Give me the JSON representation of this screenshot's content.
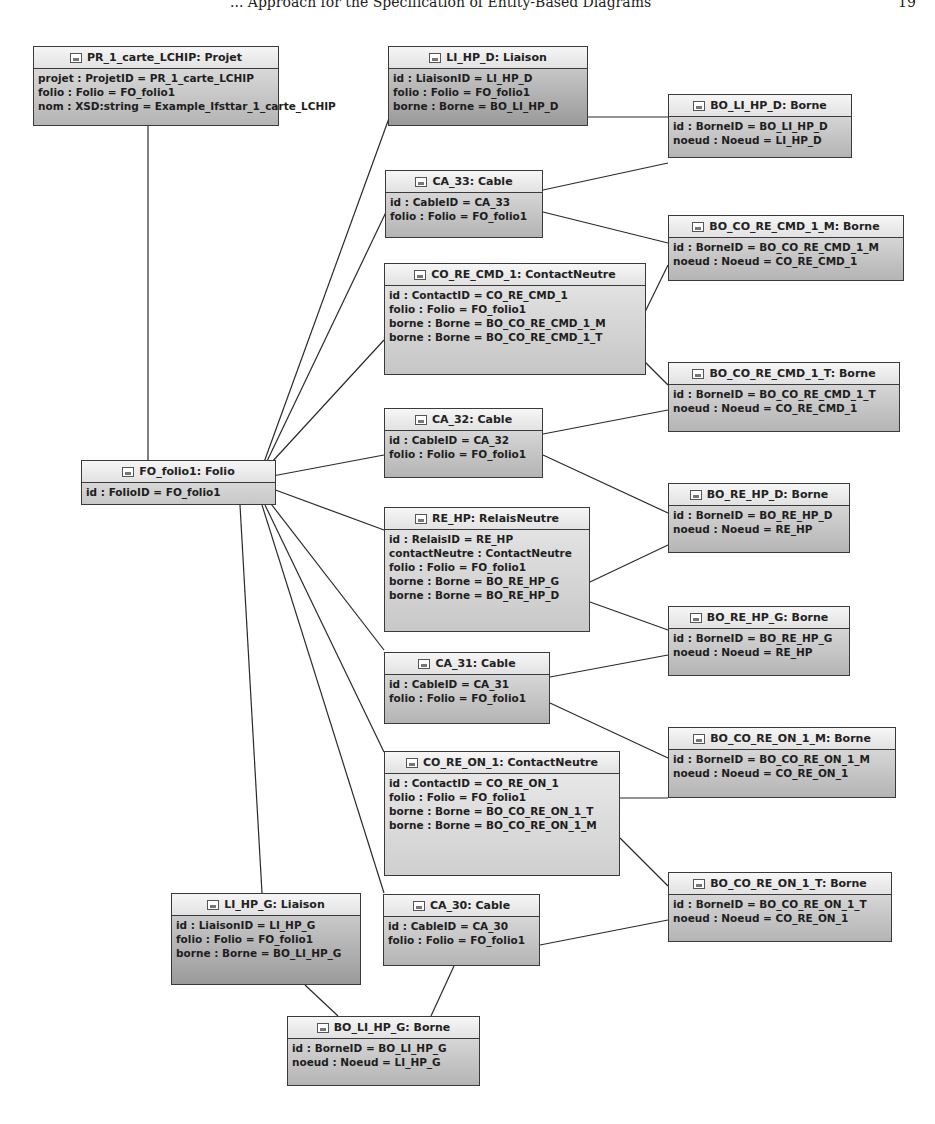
{
  "page_header": {
    "title": "... Approach for the Specification of Entity-Based Diagrams",
    "page_number": "19"
  },
  "nodes": {
    "projet": {
      "title": "PR_1_carte_LCHIP: Projet",
      "attrs": [
        "projet : ProjetID = PR_1_carte_LCHIP",
        "folio : Folio = FO_folio1",
        "nom : XSD:string = Example_Ifsttar_1_carte_LCHIP"
      ]
    },
    "li_hp_d": {
      "title": "LI_HP_D: Liaison",
      "attrs": [
        "id : LiaisonID = LI_HP_D",
        "folio : Folio = FO_folio1",
        "borne : Borne = BO_LI_HP_D"
      ]
    },
    "bo_li_hp_d": {
      "title": "BO_LI_HP_D: Borne",
      "attrs": [
        "id : BorneID = BO_LI_HP_D",
        "noeud : Noeud = LI_HP_D"
      ]
    },
    "ca_33": {
      "title": "CA_33: Cable",
      "attrs": [
        "id : CableID = CA_33",
        "folio : Folio = FO_folio1"
      ]
    },
    "bo_co_re_cmd_1_m": {
      "title": "BO_CO_RE_CMD_1_M: Borne",
      "attrs": [
        "id : BorneID = BO_CO_RE_CMD_1_M",
        "noeud : Noeud = CO_RE_CMD_1"
      ]
    },
    "co_re_cmd_1": {
      "title": "CO_RE_CMD_1: ContactNeutre",
      "attrs": [
        "id : ContactID = CO_RE_CMD_1",
        "folio : Folio = FO_folio1",
        "borne : Borne = BO_CO_RE_CMD_1_M",
        "borne : Borne = BO_CO_RE_CMD_1_T"
      ]
    },
    "bo_co_re_cmd_1_t": {
      "title": "BO_CO_RE_CMD_1_T: Borne",
      "attrs": [
        "id : BorneID = BO_CO_RE_CMD_1_T",
        "noeud : Noeud = CO_RE_CMD_1"
      ]
    },
    "fo_folio1": {
      "title": "FO_folio1: Folio",
      "attrs": [
        "id : FolioID = FO_folio1"
      ]
    },
    "ca_32": {
      "title": "CA_32: Cable",
      "attrs": [
        "id : CableID = CA_32",
        "folio : Folio = FO_folio1"
      ]
    },
    "bo_re_hp_d": {
      "title": "BO_RE_HP_D: Borne",
      "attrs": [
        "id : BorneID = BO_RE_HP_D",
        "noeud : Noeud = RE_HP"
      ]
    },
    "re_hp": {
      "title": "RE_HP: RelaisNeutre",
      "attrs": [
        "id : RelaisID = RE_HP",
        "contactNeutre : ContactNeutre",
        "folio : Folio = FO_folio1",
        "borne : Borne = BO_RE_HP_G",
        "borne : Borne = BO_RE_HP_D"
      ]
    },
    "bo_re_hp_g": {
      "title": "BO_RE_HP_G: Borne",
      "attrs": [
        "id : BorneID = BO_RE_HP_G",
        "noeud : Noeud = RE_HP"
      ]
    },
    "ca_31": {
      "title": "CA_31: Cable",
      "attrs": [
        "id : CableID = CA_31",
        "folio : Folio = FO_folio1"
      ]
    },
    "bo_co_re_on_1_m": {
      "title": "BO_CO_RE_ON_1_M: Borne",
      "attrs": [
        "id : BorneID = BO_CO_RE_ON_1_M",
        "noeud : Noeud = CO_RE_ON_1"
      ]
    },
    "co_re_on_1": {
      "title": "CO_RE_ON_1: ContactNeutre",
      "attrs": [
        "id : ContactID = CO_RE_ON_1",
        "folio : Folio = FO_folio1",
        "borne : Borne = BO_CO_RE_ON_1_T",
        "borne : Borne = BO_CO_RE_ON_1_M"
      ]
    },
    "bo_co_re_on_1_t": {
      "title": "BO_CO_RE_ON_1_T: Borne",
      "attrs": [
        "id : BorneID = BO_CO_RE_ON_1_T",
        "noeud : Noeud = CO_RE_ON_1"
      ]
    },
    "li_hp_g": {
      "title": "LI_HP_G: Liaison",
      "attrs": [
        "id : LiaisonID = LI_HP_G",
        "folio : Folio = FO_folio1",
        "borne : Borne = BO_LI_HP_G"
      ]
    },
    "ca_30": {
      "title": "CA_30: Cable",
      "attrs": [
        "id : CableID = CA_30",
        "folio : Folio = FO_folio1"
      ]
    },
    "bo_li_hp_g": {
      "title": "BO_LI_HP_G: Borne",
      "attrs": [
        "id : BorneID = BO_LI_HP_G",
        "noeud : Noeud = LI_HP_G"
      ]
    }
  },
  "icon": "object-instance-icon",
  "colors": {
    "border": "#3a3a3a",
    "header_bg": "#f0f0f0",
    "body_top": "#e6e6e6",
    "body_bottom": "#b4b4b4",
    "line": "#2a2a2a"
  }
}
